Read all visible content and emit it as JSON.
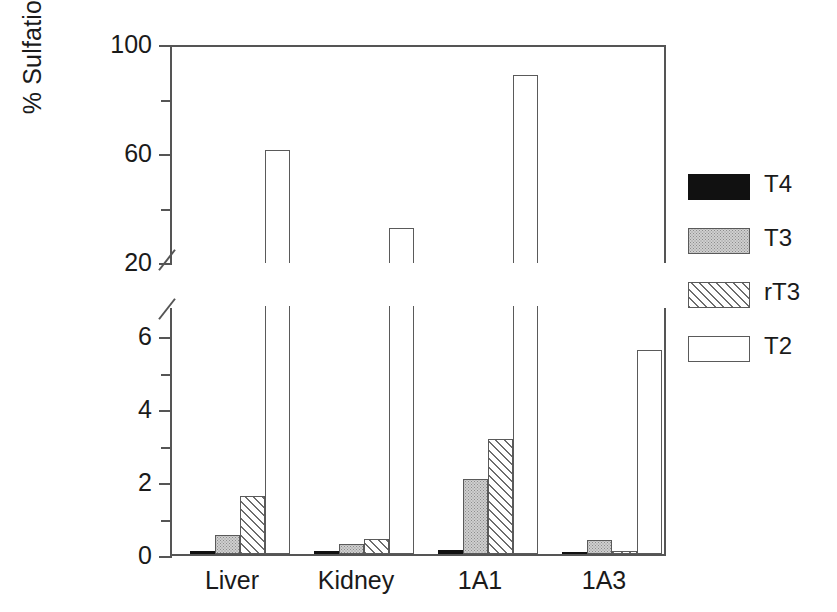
{
  "chart_data": {
    "type": "bar",
    "title": "",
    "xlabel": "",
    "ylabel": "% Sulfation",
    "grid": false,
    "legend_position": "right",
    "broken_axis": true,
    "axis_note": "y-axis broken between 6.8 and 20",
    "lower_axis": {
      "ylim": [
        0,
        6.8
      ],
      "major_ticks": [
        0,
        2,
        4,
        6
      ],
      "minor_ticks": [
        1,
        3,
        5
      ],
      "tick_labels": [
        "0",
        "2",
        "4",
        "6"
      ]
    },
    "upper_axis": {
      "ylim": [
        20,
        100
      ],
      "major_ticks": [
        20,
        60,
        100
      ],
      "minor_ticks": [
        40,
        80
      ],
      "tick_labels": [
        "20",
        "60",
        "100"
      ]
    },
    "categories": [
      "Liver",
      "Kidney",
      "1A1",
      "1A3"
    ],
    "series": [
      {
        "name": "T4",
        "fill": "solid-black",
        "values": [
          0.08,
          0.07,
          0.12,
          0.03
        ]
      },
      {
        "name": "T3",
        "fill": "gray-stipple",
        "values": [
          0.52,
          0.28,
          2.05,
          0.38
        ]
      },
      {
        "name": "rT3",
        "fill": "diagonal-hatch",
        "values": [
          1.58,
          0.42,
          3.15,
          0.08
        ]
      },
      {
        "name": "T2",
        "fill": "open-white",
        "values": [
          61.5,
          33.0,
          89.0,
          5.6
        ]
      }
    ]
  },
  "axis": {
    "y_title": "% Sulfation",
    "upper_labels": [
      {
        "text": "100",
        "value": 100
      },
      {
        "text": "60",
        "value": 60
      },
      {
        "text": "20",
        "value": 20
      }
    ],
    "lower_labels": [
      {
        "text": "6",
        "value": 6
      },
      {
        "text": "4",
        "value": 4
      },
      {
        "text": "2",
        "value": 2
      },
      {
        "text": "0",
        "value": 0
      }
    ],
    "x_labels": [
      "Liver",
      "Kidney",
      "1A1",
      "1A3"
    ]
  },
  "legend": {
    "items": [
      {
        "label": "T4",
        "fill": "solid-black"
      },
      {
        "label": "T3",
        "fill": "gray-stipple"
      },
      {
        "label": "rT3",
        "fill": "diagonal-hatch"
      },
      {
        "label": "T2",
        "fill": "open-white"
      }
    ]
  },
  "colors": {
    "axis": "#555555",
    "bar_outline": "#5a5a5a",
    "t4_fill": "#111111",
    "t3_fill": "#cfcfcf",
    "rt3_hatch": "#6d6d6d",
    "t2_fill": "#ffffff",
    "background": "#ffffff"
  }
}
